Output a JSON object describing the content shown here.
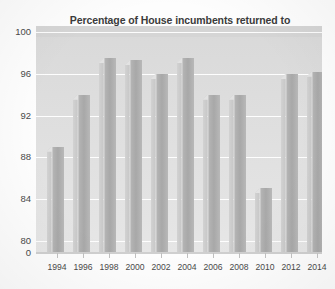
{
  "chart_data": {
    "type": "bar",
    "title": "Percentage of House incumbents returned to\noffice, 1994−2014",
    "title_line1": "Percentage of House incumbents returned to",
    "title_line2": "office, 1994−2014",
    "xlabel": "",
    "ylabel": "",
    "categories": [
      "1994",
      "1996",
      "1998",
      "2000",
      "2002",
      "2004",
      "2006",
      "2008",
      "2010",
      "2012",
      "2014"
    ],
    "values": [
      89.0,
      94.0,
      97.5,
      97.3,
      96.0,
      97.5,
      94.0,
      94.0,
      85.0,
      96.0,
      96.2
    ],
    "series": [
      {
        "name": "Percentage returned",
        "values": [
          89.0,
          94.0,
          97.5,
          97.3,
          96.0,
          97.5,
          94.0,
          94.0,
          85.0,
          96.0,
          96.2
        ]
      }
    ],
    "ylim": [
      78.8,
      100.6
    ],
    "y_ticks": [
      "100",
      "96",
      "92",
      "88",
      "84",
      "80",
      "0"
    ],
    "y_tick_values": [
      100,
      96,
      92,
      88,
      84,
      80,
      0
    ],
    "axis_broken": true,
    "grid": true,
    "grid_orientation": "horizontal",
    "legend": null,
    "legend_position": "none",
    "style": "3d-bars",
    "colors": {
      "bar_front": "#a8a8a8",
      "bar_side": "#cacaca",
      "bar_top": "#e2e2e2",
      "plot_background": "#dcdcdc",
      "gridline": "#ffffff",
      "title_text": "#3b3b3b",
      "axis_text": "#4a4a4a",
      "page_background": "#fdfdfd"
    }
  }
}
